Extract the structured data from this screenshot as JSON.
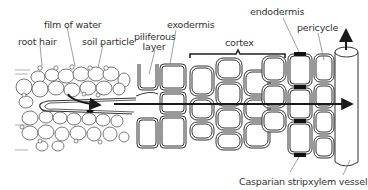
{
  "labels": {
    "root_hair": "root hair",
    "film_of_water": "film of water",
    "soil_particle": "soil particle",
    "piliferous_line1": "piliferous",
    "piliferous_line2": "layer",
    "exodermis": "exodermis",
    "cortex": "cortex",
    "endodermis": "endodermis",
    "pericycle": "pericycle",
    "casparian_strip": "Casparian strip",
    "xylem_vessel": "xylem vessel"
  },
  "colors": {
    "line": "#3a3a3a",
    "arrow": "#1a1a1a",
    "strip": "#111111",
    "leader": "#777777"
  }
}
